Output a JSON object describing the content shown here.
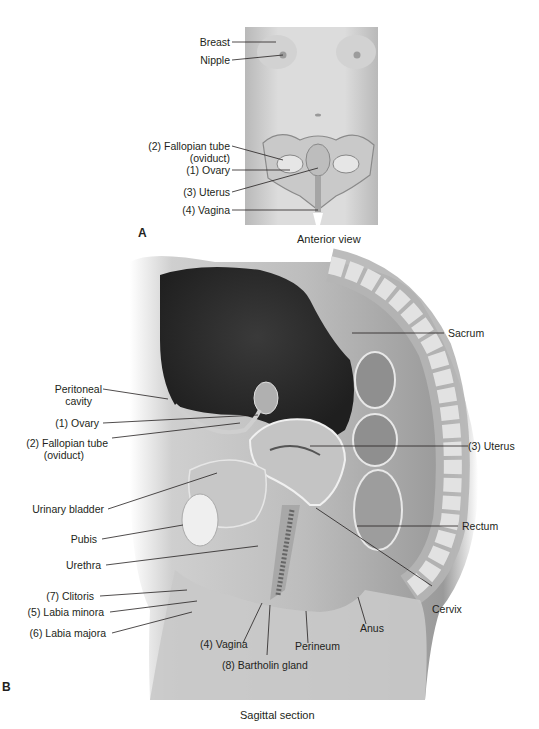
{
  "panel_a": {
    "letter": "A",
    "caption": "Anterior view",
    "labels": {
      "breast": "Breast",
      "nipple": "Nipple",
      "fallopian_1": "(2) Fallopian tube",
      "fallopian_2": "(oviduct)",
      "ovary": "(1) Ovary",
      "uterus": "(3) Uterus",
      "vagina": "(4) Vagina"
    }
  },
  "panel_b": {
    "letter": "B",
    "caption": "Sagittal section",
    "labels": {
      "peritoneal_1": "Peritoneal",
      "peritoneal_2": "cavity",
      "ovary": "(1) Ovary",
      "fallopian_1": "(2) Fallopian tube",
      "fallopian_2": "(oviduct)",
      "urinary_bladder": "Urinary bladder",
      "pubis": "Pubis",
      "urethra": "Urethra",
      "clitoris": "(7) Clitoris",
      "labia_minora": "(5) Labia minora",
      "labia_majora": "(6) Labia majora",
      "vagina": "(4) Vagina",
      "bartholin": "(8) Bartholin gland",
      "perineum": "Perineum",
      "anus": "Anus",
      "cervix": "Cervix",
      "rectum": "Rectum",
      "uterus": "(3) Uterus",
      "sacrum": "Sacrum"
    }
  },
  "colors": {
    "skin_light": "#d9d9d9",
    "skin_mid": "#a9a9a9",
    "cavity_dark": "#2e2e2e",
    "text": "#231f20",
    "leader_line": "#231f20"
  }
}
